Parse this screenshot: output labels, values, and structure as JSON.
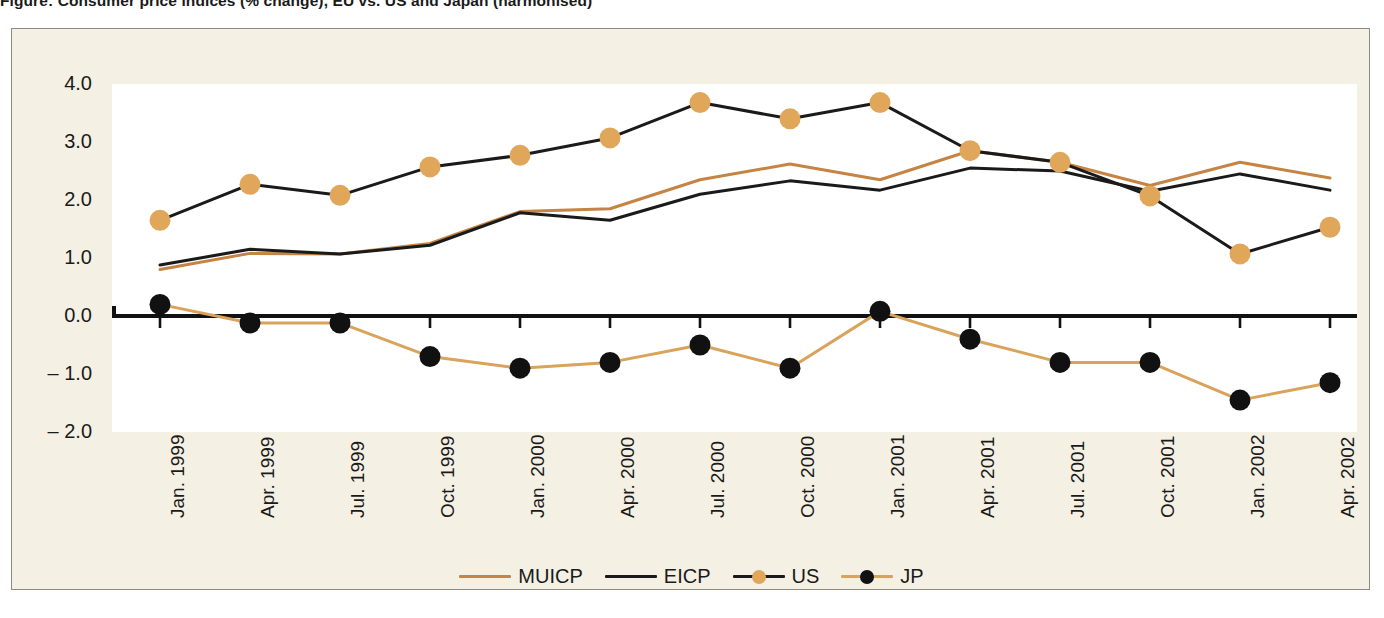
{
  "figure": {
    "title": "Figure: Consumer price indices (% change), EU vs. US and Japan (harmonised)",
    "frame_color": "#8d8b84",
    "panel_bg": "#f5f0e4",
    "plot_bg": "#ffffff"
  },
  "chart_data": {
    "type": "line",
    "title": "",
    "xlabel": "",
    "ylabel": "",
    "ylim": [
      -2.0,
      4.0
    ],
    "yticks": [
      4.0,
      3.0,
      2.0,
      1.0,
      0.0,
      -1.0,
      -2.0
    ],
    "ytick_labels": [
      "4.0",
      "3.0",
      "2.0",
      "1.0",
      "0.0",
      "– 1.0",
      "– 2.0"
    ],
    "grid": false,
    "zero_line": true,
    "legend_position": "bottom-center",
    "categories": [
      "Jan. 1999",
      "Apr. 1999",
      "Jul. 1999",
      "Oct. 1999",
      "Jan. 2000",
      "Apr. 2000",
      "Jul. 2000",
      "Oct. 2000",
      "Jan. 2001",
      "Apr. 2001",
      "Jul. 2001",
      "Oct. 2001",
      "Jan. 2002",
      "Apr. 2002"
    ],
    "series": [
      {
        "name": "MUICP",
        "color": "#c58344",
        "marker": "none",
        "line_width": 3.0,
        "values": [
          0.8,
          1.08,
          1.07,
          1.25,
          1.8,
          1.85,
          2.35,
          2.62,
          2.35,
          2.85,
          2.65,
          2.25,
          2.65,
          2.38
        ]
      },
      {
        "name": "EICP",
        "color": "#1a1a1a",
        "marker": "none",
        "line_width": 3.0,
        "values": [
          0.88,
          1.15,
          1.07,
          1.22,
          1.78,
          1.65,
          2.1,
          2.33,
          2.17,
          2.55,
          2.5,
          2.15,
          2.45,
          2.17
        ]
      },
      {
        "name": "US",
        "color": "#1a1a1a",
        "marker_color": "#e2a council",
        "marker": "circle",
        "line_width": 3.0,
        "values": [
          1.65,
          2.27,
          2.08,
          2.57,
          2.77,
          3.07,
          3.68,
          3.4,
          3.68,
          2.85,
          2.65,
          2.07,
          1.07,
          1.53
        ]
      },
      {
        "name": "JP",
        "color": "#d9a35c",
        "marker_color": "#111111",
        "marker": "circle",
        "line_width": 3.0,
        "values": [
          0.2,
          -0.12,
          -0.12,
          -0.7,
          -0.9,
          -0.8,
          -0.5,
          -0.9,
          0.08,
          -0.4,
          -0.8,
          -0.8,
          -1.45,
          -1.15
        ]
      }
    ]
  },
  "legend": {
    "items": [
      {
        "label": "MUICP",
        "line_color": "#c58344",
        "dot_color": null
      },
      {
        "label": "EICP",
        "line_color": "#1a1a1a",
        "dot_color": null
      },
      {
        "label": "US",
        "line_color": "#1a1a1a",
        "dot_color": "#e0a65a"
      },
      {
        "label": "JP",
        "line_color": "#d9a35c",
        "dot_color": "#111111"
      }
    ]
  },
  "colors": {
    "orange_line": "#c58344",
    "orange_marker": "#e0a65a",
    "jp_line": "#d9a35c",
    "black": "#1a1a1a"
  }
}
